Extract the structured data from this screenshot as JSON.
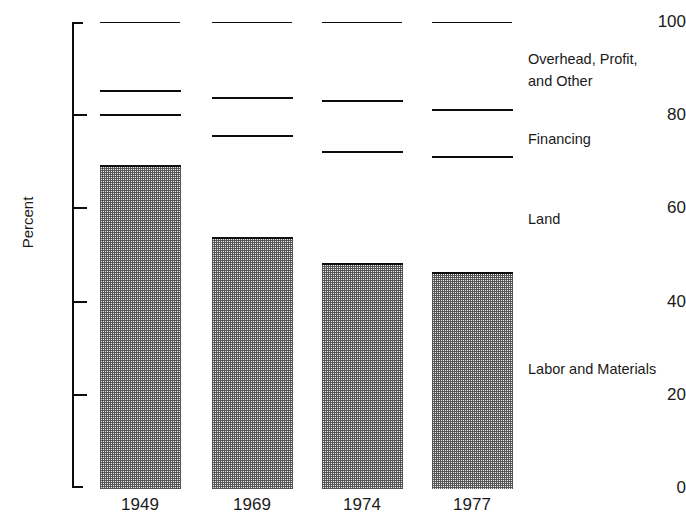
{
  "chart_data": {
    "type": "bar",
    "subtype": "stacked-bar-100",
    "title": "",
    "xlabel": "",
    "ylabel": "Percent",
    "ylim": [
      0,
      100
    ],
    "yticks": [
      0,
      20,
      40,
      60,
      80,
      100
    ],
    "ytick_labels": [
      "0",
      "20",
      "40",
      "60",
      "80",
      "100"
    ],
    "grid": false,
    "legend_position": "right-of-bars-inline",
    "categories": [
      "1949",
      "1969",
      "1974",
      "1977"
    ],
    "series": [
      {
        "name": "Labor and Materials",
        "fill": "stipple",
        "values": [
          69,
          53.5,
          48,
          46
        ]
      },
      {
        "name": "Land",
        "fill": "white",
        "values": [
          11,
          22,
          24,
          25
        ]
      },
      {
        "name": "Financing",
        "fill": "white",
        "values": [
          5,
          8,
          11,
          10
        ]
      },
      {
        "name": "Overhead, Profit, and Other",
        "fill": "white",
        "values": [
          15,
          16.5,
          17,
          19
        ]
      }
    ],
    "cumulative_tops": {
      "1949": {
        "labor_and_materials": 69,
        "land": 80,
        "financing": 85,
        "overhead_profit_and_other": 100
      },
      "1969": {
        "labor_and_materials": 53.5,
        "land": 75.5,
        "financing": 83.5,
        "overhead_profit_and_other": 100
      },
      "1974": {
        "labor_and_materials": 48,
        "land": 72,
        "financing": 83,
        "overhead_profit_and_other": 100
      },
      "1977": {
        "labor_and_materials": 46,
        "land": 71,
        "financing": 81,
        "overhead_profit_and_other": 100
      }
    }
  },
  "axis": {
    "y_title": "Percent",
    "y_ticks": [
      {
        "label": "100",
        "value": 100
      },
      {
        "label": "80",
        "value": 80
      },
      {
        "label": "60",
        "value": 60
      },
      {
        "label": "40",
        "value": 40
      },
      {
        "label": "20",
        "value": 20
      },
      {
        "label": "0",
        "value": 0
      }
    ],
    "x_ticks": [
      "1949",
      "1969",
      "1974",
      "1977"
    ]
  },
  "legend": {
    "items": [
      {
        "label": "Overhead, Profit,\nand Other",
        "top_px": 48
      },
      {
        "label": "Financing",
        "top_px": 128
      },
      {
        "label": "Land",
        "top_px": 208
      },
      {
        "label": "Labor and Materials",
        "top_px": 358
      }
    ]
  },
  "colors": {
    "ink": "#0d0d0d",
    "text": "#1a1a1a",
    "stipple_fill": "#e8e8e8",
    "white_fill": "#ffffff",
    "background": "#ffffff"
  }
}
